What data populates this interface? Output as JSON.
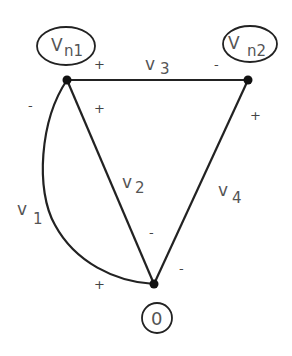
{
  "diagram": {
    "type": "circuit-graph",
    "nodes": [
      {
        "id": "n1",
        "label_main": "V",
        "label_sub": "n1"
      },
      {
        "id": "n2",
        "label_main": "V",
        "label_sub": "n2"
      },
      {
        "id": "ground",
        "label": "0"
      }
    ],
    "branches": [
      {
        "id": "v1",
        "label_main": "v",
        "label_sub": "1",
        "from": "ground",
        "to": "n1",
        "plus_sign": "+",
        "minus_sign": "-",
        "shape": "curve"
      },
      {
        "id": "v2",
        "label_main": "v",
        "label_sub": "2",
        "from": "n1",
        "to": "ground",
        "plus_sign": "+",
        "minus_sign": "-"
      },
      {
        "id": "v3",
        "label_main": "v",
        "label_sub": "3",
        "from": "n1",
        "to": "n2",
        "plus_sign": "+",
        "minus_sign": "-"
      },
      {
        "id": "v4",
        "label_main": "v",
        "label_sub": "4",
        "from": "n2",
        "to": "ground",
        "plus_sign": "+",
        "minus_sign": "-"
      }
    ],
    "colors": {
      "line": "#222222",
      "text": "#555555"
    }
  }
}
